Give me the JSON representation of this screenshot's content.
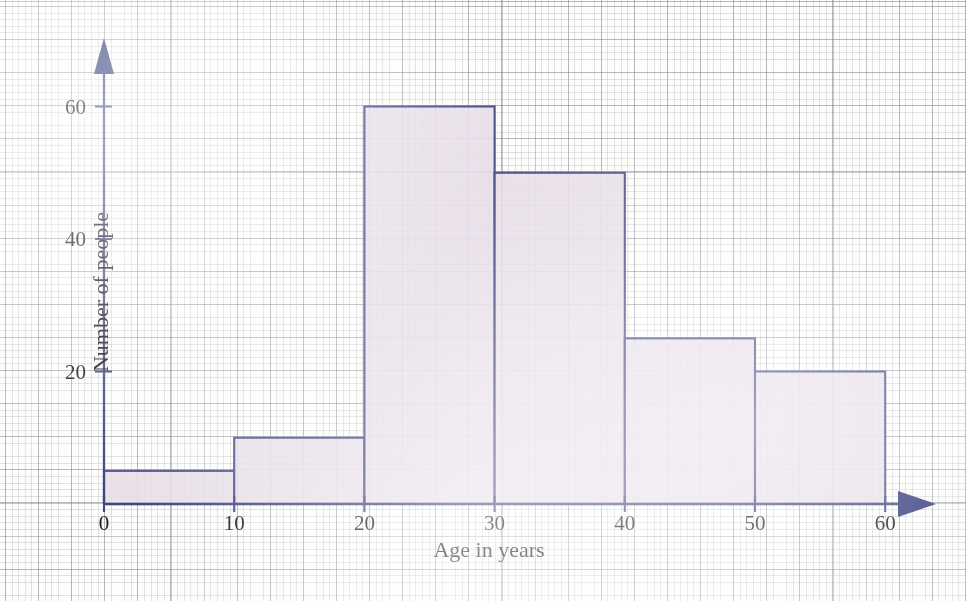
{
  "chart_data": {
    "type": "bar",
    "title": "",
    "subtitle": "",
    "xlabel": "Age in years",
    "ylabel": "Number of people",
    "categories": [
      "0-10",
      "10-20",
      "20-30",
      "30-40",
      "40-50",
      "50-60"
    ],
    "bin_edges": [
      0,
      10,
      20,
      30,
      40,
      50,
      60
    ],
    "values": [
      5,
      10,
      60,
      50,
      25,
      20
    ],
    "xlim": [
      0,
      60
    ],
    "ylim": [
      0,
      65
    ],
    "x_ticks": [
      "0",
      "10",
      "20",
      "30",
      "40",
      "50",
      "60"
    ],
    "x_tick_values": [
      0,
      10,
      20,
      30,
      40,
      50,
      60
    ],
    "y_ticks": [
      "20",
      "40",
      "60"
    ],
    "y_tick_values": [
      20,
      40,
      60
    ],
    "grid": true,
    "grid_style": "graph-paper",
    "legend": "none",
    "bar_fill_color": "#e7dde8",
    "bar_edge_color": "#51538c",
    "axis_color": "#3f4680",
    "background_color": "#fdfdfb",
    "arrow_heads": [
      "x-axis-right",
      "y-axis-up"
    ]
  },
  "axes": {
    "x_title": "Age in years",
    "y_title": "Number of people"
  },
  "x_labels": [
    {
      "text": "0",
      "value": 0
    },
    {
      "text": "10",
      "value": 10
    },
    {
      "text": "20",
      "value": 20
    },
    {
      "text": "30",
      "value": 30
    },
    {
      "text": "40",
      "value": 40
    },
    {
      "text": "50",
      "value": 50
    },
    {
      "text": "60",
      "value": 60
    }
  ],
  "y_labels": [
    {
      "text": "20",
      "value": 20
    },
    {
      "text": "40",
      "value": 40
    },
    {
      "text": "60",
      "value": 60
    }
  ]
}
